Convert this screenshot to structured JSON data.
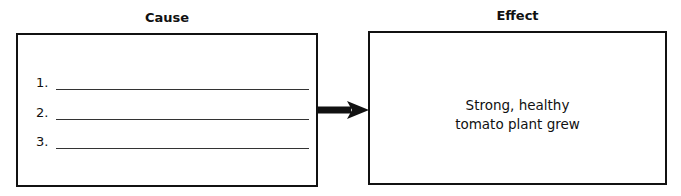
{
  "cause": {
    "title": "Cause",
    "items": [
      {
        "number": "1.",
        "value": ""
      },
      {
        "number": "2.",
        "value": ""
      },
      {
        "number": "3.",
        "value": ""
      }
    ]
  },
  "effect": {
    "title": "Effect",
    "text_line1": "Strong, healthy",
    "text_line2": "tomato plant grew"
  },
  "arrow": {
    "icon": "right-arrow-icon",
    "color": "#111111"
  }
}
